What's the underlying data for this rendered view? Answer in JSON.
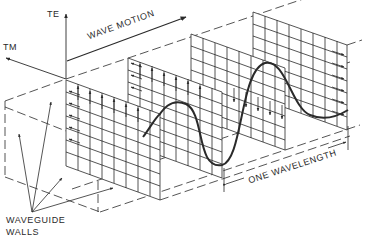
{
  "diagram": {
    "labels": {
      "te": "TE",
      "tm": "TM",
      "wave_motion": "WAVE MOTION",
      "one_wavelength": "ONE WAVELENGTH",
      "waveguide_line1": "WAVEGUIDE",
      "waveguide_line2": "WALLS"
    },
    "icons": {
      "axis_arrow": "arrow-icon",
      "field_arrow": "field-arrow-icon"
    },
    "colors": {
      "ink": "#2a2a2a",
      "background": "#ffffff"
    }
  }
}
